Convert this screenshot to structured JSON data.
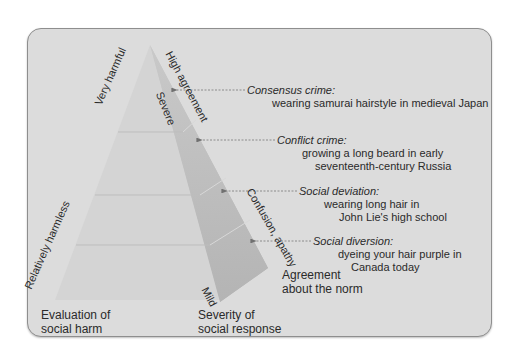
{
  "colors": {
    "background": "#ffffff",
    "panel": "#dcdcdc",
    "panel_border": "#8e8e8e",
    "front_face": "#d3d3d3",
    "side_face_top": "#c4c4c4",
    "side_face_bottom": "#b7b7b7",
    "divider": "#bdbdbd",
    "arrow": "#777777",
    "text": "#2a2a2a"
  },
  "axes": {
    "left_edge": {
      "top_label": "Very harmful",
      "bottom_label": "Relatively harmless",
      "axis_title_line1": "Evaluation of",
      "axis_title_line2": "social harm"
    },
    "inner_edge": {
      "top_label": "Severe",
      "bottom_label": "Mild",
      "axis_title_line1": "Severity of",
      "axis_title_line2": "social response"
    },
    "right_edge": {
      "top_label": "High agreement",
      "bottom_label": "Confusion, apathy",
      "axis_title_line1": "Agreement",
      "axis_title_line2": "about the norm"
    }
  },
  "levels": [
    {
      "name": "Consensus crime:",
      "example_line1": "wearing samurai hairstyle in medieval Japan",
      "example_line2": ""
    },
    {
      "name": "Conflict crime:",
      "example_line1": "growing a long beard in early",
      "example_line2": "seventeenth-century Russia"
    },
    {
      "name": "Social deviation:",
      "example_line1": "wearing long hair in",
      "example_line2": "John Lie's high school"
    },
    {
      "name": "Social diversion:",
      "example_line1": "dyeing your hair purple in",
      "example_line2": "Canada today"
    }
  ]
}
